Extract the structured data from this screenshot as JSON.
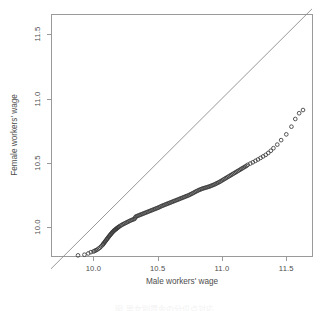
{
  "figure": {
    "kind": "qq-plot",
    "background": "#ffffff",
    "frame_color": "#9a9a9a",
    "point_color": "#3a3a3a",
    "line_color": "#8c8c8c"
  },
  "axes": {
    "x_label": "Male workers' wage",
    "y_label": "Female workers' wage",
    "x_ticks": [
      "10.0",
      "10.5",
      "11.0",
      "11.5"
    ],
    "y_ticks": [
      "10.0",
      "10.5",
      "11.0",
      "11.5"
    ]
  },
  "caption": "図  男女別賃金の分位点対応",
  "chart_data": {
    "type": "scatter",
    "title": "",
    "xlabel": "Male workers' wage",
    "ylabel": "Female workers' wage",
    "xlim": [
      9.67,
      11.7
    ],
    "ylim": [
      9.77,
      11.66
    ],
    "xticks": [
      10.0,
      10.5,
      11.0,
      11.5
    ],
    "yticks": [
      10.0,
      10.5,
      11.0,
      11.5
    ],
    "grid": false,
    "legend": null,
    "marker": "open-circle",
    "reference_line": {
      "type": "identity",
      "description": "y = x diagonal",
      "from": [
        9.67,
        9.67
      ],
      "to": [
        11.7,
        11.7
      ]
    },
    "x": [
      9.88,
      9.93,
      9.96,
      9.98,
      10.0,
      10.01,
      10.02,
      10.03,
      10.04,
      10.05,
      10.06,
      10.07,
      10.075,
      10.08,
      10.085,
      10.09,
      10.095,
      10.1,
      10.105,
      10.11,
      10.115,
      10.12,
      10.125,
      10.13,
      10.135,
      10.14,
      10.145,
      10.15,
      10.155,
      10.16,
      10.165,
      10.17,
      10.175,
      10.18,
      10.185,
      10.19,
      10.195,
      10.2,
      10.21,
      10.22,
      10.23,
      10.24,
      10.25,
      10.26,
      10.27,
      10.28,
      10.29,
      10.3,
      10.31,
      10.32,
      10.325,
      10.33,
      10.34,
      10.35,
      10.36,
      10.37,
      10.38,
      10.39,
      10.4,
      10.41,
      10.42,
      10.43,
      10.44,
      10.45,
      10.46,
      10.47,
      10.48,
      10.49,
      10.5,
      10.51,
      10.52,
      10.53,
      10.54,
      10.55,
      10.56,
      10.57,
      10.58,
      10.59,
      10.6,
      10.61,
      10.62,
      10.63,
      10.64,
      10.65,
      10.66,
      10.67,
      10.68,
      10.69,
      10.7,
      10.71,
      10.72,
      10.73,
      10.74,
      10.75,
      10.76,
      10.77,
      10.78,
      10.79,
      10.8,
      10.81,
      10.82,
      10.83,
      10.84,
      10.85,
      10.86,
      10.87,
      10.88,
      10.89,
      10.9,
      10.91,
      10.92,
      10.93,
      10.94,
      10.95,
      10.96,
      10.97,
      10.98,
      10.99,
      11.0,
      11.01,
      11.02,
      11.03,
      11.04,
      11.05,
      11.06,
      11.07,
      11.08,
      11.09,
      11.1,
      11.11,
      11.12,
      11.13,
      11.14,
      11.15,
      11.16,
      11.17,
      11.18,
      11.19,
      11.2,
      11.22,
      11.24,
      11.26,
      11.28,
      11.3,
      11.32,
      11.34,
      11.36,
      11.38,
      11.4,
      11.43,
      11.46,
      11.5,
      11.54,
      11.57,
      11.6,
      11.63
    ],
    "y": [
      9.775,
      9.78,
      9.79,
      9.8,
      9.805,
      9.81,
      9.815,
      9.82,
      9.828,
      9.835,
      9.845,
      9.855,
      9.862,
      9.868,
      9.875,
      9.882,
      9.888,
      9.895,
      9.902,
      9.908,
      9.915,
      9.922,
      9.928,
      9.934,
      9.94,
      9.946,
      9.952,
      9.958,
      9.963,
      9.968,
      9.972,
      9.976,
      9.98,
      9.984,
      9.988,
      9.992,
      9.996,
      10.0,
      10.006,
      10.012,
      10.018,
      10.023,
      10.028,
      10.033,
      10.038,
      10.043,
      10.048,
      10.052,
      10.056,
      10.06,
      10.07,
      10.078,
      10.082,
      10.086,
      10.09,
      10.094,
      10.098,
      10.102,
      10.106,
      10.11,
      10.114,
      10.118,
      10.122,
      10.126,
      10.13,
      10.134,
      10.138,
      10.142,
      10.146,
      10.15,
      10.155,
      10.16,
      10.164,
      10.168,
      10.172,
      10.176,
      10.18,
      10.184,
      10.188,
      10.192,
      10.196,
      10.2,
      10.204,
      10.208,
      10.212,
      10.216,
      10.22,
      10.224,
      10.228,
      10.232,
      10.236,
      10.24,
      10.244,
      10.249,
      10.254,
      10.259,
      10.264,
      10.27,
      10.275,
      10.28,
      10.285,
      10.289,
      10.293,
      10.297,
      10.3,
      10.303,
      10.306,
      10.309,
      10.312,
      10.316,
      10.32,
      10.324,
      10.328,
      10.333,
      10.338,
      10.343,
      10.348,
      10.354,
      10.36,
      10.366,
      10.372,
      10.378,
      10.384,
      10.39,
      10.396,
      10.402,
      10.408,
      10.414,
      10.42,
      10.426,
      10.432,
      10.438,
      10.444,
      10.45,
      10.456,
      10.462,
      10.468,
      10.474,
      10.482,
      10.492,
      10.502,
      10.513,
      10.524,
      10.536,
      10.548,
      10.56,
      10.575,
      10.592,
      10.612,
      10.64,
      10.675,
      10.72,
      10.78,
      10.84,
      10.885,
      10.91,
      10.945
    ]
  }
}
